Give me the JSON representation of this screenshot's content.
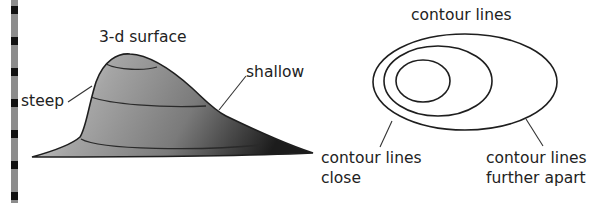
{
  "surface": {
    "title": "3-d surface",
    "steep_label": "steep",
    "shallow_label": "shallow"
  },
  "contours": {
    "title": "contour lines",
    "close_label_line1": "contour lines",
    "close_label_line2": "close",
    "apart_label_line1": "contour lines",
    "apart_label_line2": "further apart"
  },
  "colors": {
    "stroke": "#1e1e1e",
    "surface_light": "#dcdcdc",
    "surface_mid": "#9a9a9a",
    "surface_dark": "#2a2a2a",
    "binding_strip": "#8c8c8c",
    "binding_mark": "#111111"
  }
}
